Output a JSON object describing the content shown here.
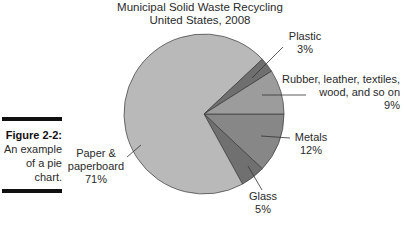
{
  "chart_data": {
    "type": "pie",
    "title": "Municipal Solid Waste Recycling",
    "subtitle": "United States, 2008",
    "categories": [
      "Paper & paperboard",
      "Plastic",
      "Rubber, leather, textiles, wood, and so on",
      "Metals",
      "Glass"
    ],
    "values": [
      71,
      3,
      9,
      12,
      5
    ],
    "units": "%",
    "slices": [
      {
        "label": "Paper & paperboard",
        "value": 71,
        "display": "71%",
        "color": "#b9b9b9"
      },
      {
        "label": "Plastic",
        "value": 3,
        "display": "3%",
        "color": "#6f6f6f"
      },
      {
        "label": "Rubber, leather, textiles, wood, and so on",
        "value": 9,
        "display": "9%",
        "color": "#9c9c9c"
      },
      {
        "label": "Metals",
        "value": 12,
        "display": "12%",
        "color": "#878787"
      },
      {
        "label": "Glass",
        "value": 5,
        "display": "5%",
        "color": "#707070"
      }
    ],
    "legend": "none (callout labels with leader lines)"
  },
  "chart": {
    "title_line1": "Municipal Solid Waste Recycling",
    "title_line2": "United States, 2008"
  },
  "labels": {
    "plastic": {
      "name": "Plastic",
      "pct": "3%"
    },
    "rubber": {
      "line1": "Rubber, leather, textiles,",
      "line2": "wood, and so on",
      "pct": "9%"
    },
    "metals": {
      "name": "Metals",
      "pct": "12%"
    },
    "glass": {
      "name": "Glass",
      "pct": "5%"
    },
    "paper": {
      "line1": "Paper &",
      "line2": "paperboard",
      "pct": "71%"
    }
  },
  "caption": {
    "heading": "Figure 2-2:",
    "line1": "An example",
    "line2": "of a pie",
    "line3": "chart."
  }
}
